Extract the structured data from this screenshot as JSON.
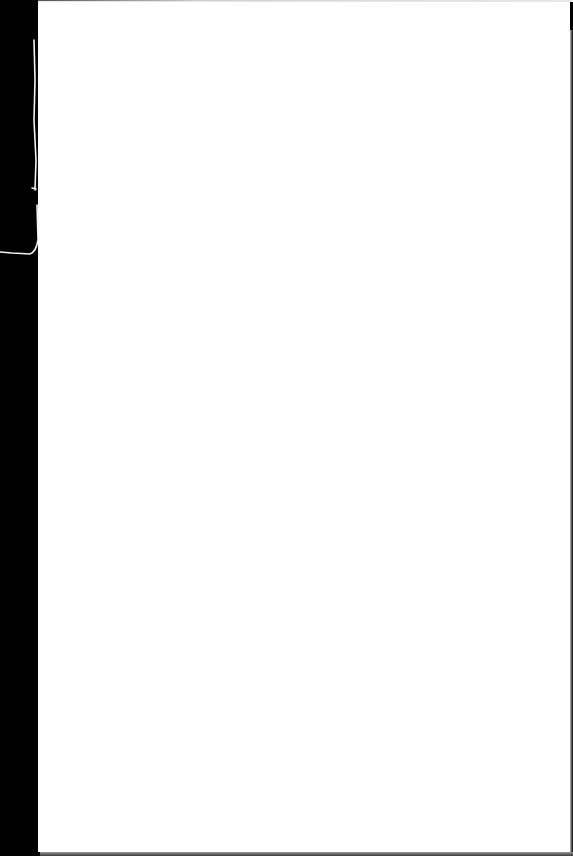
{
  "scene": {
    "description": "blank white sheet of paper on black background",
    "background_color": "#000000",
    "paper_color": "#ffffff",
    "visible_text": ""
  }
}
